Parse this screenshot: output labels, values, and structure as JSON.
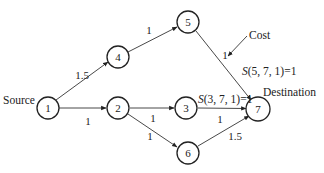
{
  "diagram": {
    "type": "directed-graph",
    "nodes": [
      {
        "id": "1",
        "label": "1",
        "x": 48,
        "y": 108
      },
      {
        "id": "2",
        "label": "2",
        "x": 118,
        "y": 108
      },
      {
        "id": "3",
        "label": "3",
        "x": 186,
        "y": 108
      },
      {
        "id": "4",
        "label": "4",
        "x": 118,
        "y": 57
      },
      {
        "id": "5",
        "label": "5",
        "x": 188,
        "y": 22
      },
      {
        "id": "6",
        "label": "6",
        "x": 188,
        "y": 153
      },
      {
        "id": "7",
        "label": "7",
        "x": 258,
        "y": 109
      }
    ],
    "edges": [
      {
        "from": "1",
        "to": "4",
        "cost": "1.5"
      },
      {
        "from": "4",
        "to": "5",
        "cost": "1"
      },
      {
        "from": "5",
        "to": "7",
        "cost": "1"
      },
      {
        "from": "1",
        "to": "2",
        "cost": "1"
      },
      {
        "from": "2",
        "to": "3",
        "cost": "1"
      },
      {
        "from": "3",
        "to": "7",
        "cost": "1"
      },
      {
        "from": "2",
        "to": "6",
        "cost": "1"
      },
      {
        "from": "6",
        "to": "7",
        "cost": "1.5"
      }
    ],
    "labels": {
      "source": "Source",
      "destination": "Destination",
      "cost": "Cost",
      "s_5_7": "(5, 7, 1)=1",
      "s_3_7": "(3, 7, 1)=1",
      "s_prefix": "S"
    }
  }
}
